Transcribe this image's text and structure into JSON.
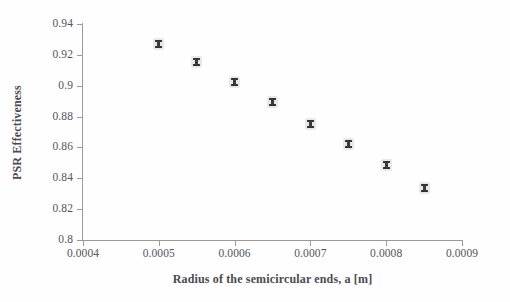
{
  "chart_data": {
    "type": "scatter",
    "title": "",
    "xlabel": "Radius of the semicircular ends, a [m]",
    "ylabel": "PSR Effectiveness",
    "xlim": [
      0.0004,
      0.0009
    ],
    "ylim": [
      0.8,
      0.94
    ],
    "grid": false,
    "legend": null,
    "marker_color": "#2f2f33",
    "axis_color": "#9a9a9a",
    "x_ticks": [
      "0.0004",
      "0.0005",
      "0.0006",
      "0.0007",
      "0.0008",
      "0.0009"
    ],
    "x_tick_values": [
      0.0004,
      0.0005,
      0.0006,
      0.0007,
      0.0008,
      0.0009
    ],
    "y_ticks": [
      "0.8",
      "0.82",
      "0.84",
      "0.86",
      "0.88",
      "0.9",
      "0.92",
      "0.94"
    ],
    "y_tick_values": [
      0.8,
      0.82,
      0.84,
      0.86,
      0.88,
      0.9,
      0.92,
      0.94
    ],
    "x": [
      0.0005,
      0.00055,
      0.0006,
      0.00065,
      0.0007,
      0.00075,
      0.0008,
      0.00085
    ],
    "y": [
      0.927,
      0.9155,
      0.9025,
      0.8895,
      0.875,
      0.862,
      0.8485,
      0.8335
    ],
    "points": [
      {
        "x": 0.0005,
        "y": 0.927
      },
      {
        "x": 0.00055,
        "y": 0.9155
      },
      {
        "x": 0.0006,
        "y": 0.9025
      },
      {
        "x": 0.00065,
        "y": 0.8895
      },
      {
        "x": 0.0007,
        "y": 0.875
      },
      {
        "x": 0.00075,
        "y": 0.862
      },
      {
        "x": 0.0008,
        "y": 0.8485
      },
      {
        "x": 0.00085,
        "y": 0.8335
      }
    ]
  }
}
